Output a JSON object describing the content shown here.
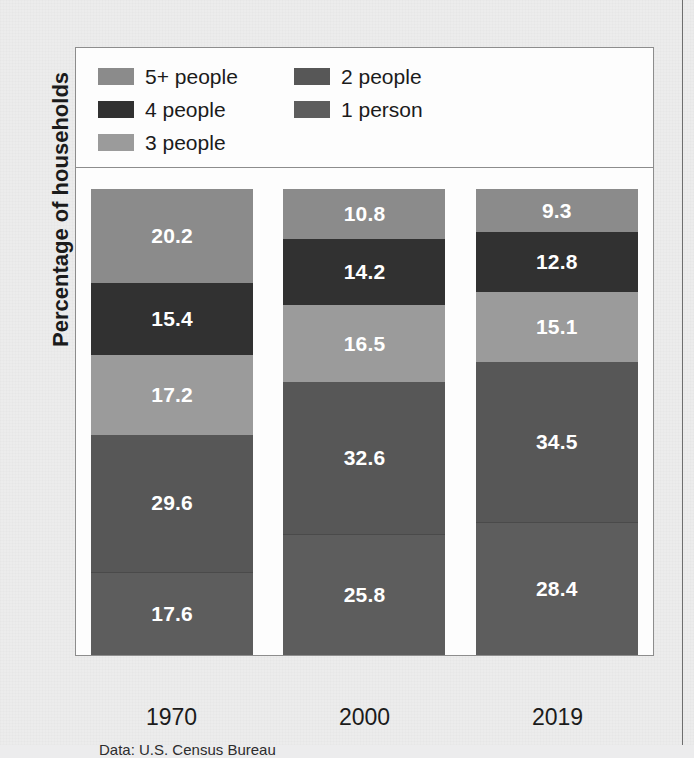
{
  "page": {
    "background_color": "#ececec",
    "partial_title_above": "",
    "column_rule_color": "#6e6e6e"
  },
  "figure": {
    "y_axis_title": "Percentage of households",
    "source_note": "Data: U.S. Census Bureau"
  },
  "legend": {
    "items": [
      {
        "label": "5+ people",
        "color": "#8b8b8b"
      },
      {
        "label": "2 people",
        "color": "#575757"
      },
      {
        "label": "4 people",
        "color": "#313131"
      },
      {
        "label": "1 person",
        "color": "#5d5d5d"
      },
      {
        "label": "3 people",
        "color": "#9b9b9b"
      }
    ]
  },
  "chart_data": {
    "type": "bar",
    "subtype": "stacked-vertical-100pct",
    "title": "",
    "xlabel": "",
    "ylabel": "Percentage of households",
    "ylim": [
      0,
      100
    ],
    "grid": false,
    "legend_position": "top",
    "categories": [
      "1970",
      "2000",
      "2019"
    ],
    "stack_order_top_to_bottom": [
      "5+ people",
      "4 people",
      "3 people",
      "2 people",
      "1 person"
    ],
    "series": [
      {
        "name": "5+ people",
        "color": "#8b8b8b",
        "values": [
          20.2,
          10.8,
          9.3
        ]
      },
      {
        "name": "4 people",
        "color": "#313131",
        "values": [
          15.4,
          14.2,
          12.8
        ]
      },
      {
        "name": "3 people",
        "color": "#9b9b9b",
        "values": [
          17.2,
          16.5,
          15.1
        ]
      },
      {
        "name": "2 people",
        "color": "#575757",
        "values": [
          29.6,
          32.6,
          34.5
        ]
      },
      {
        "name": "1 person",
        "color": "#5d5d5d",
        "values": [
          17.6,
          25.8,
          28.4
        ]
      }
    ],
    "columns": [
      {
        "category": "1970",
        "segments": [
          {
            "name": "5+ people",
            "value": 20.2,
            "label": "20.2",
            "color": "#8b8b8b"
          },
          {
            "name": "4 people",
            "value": 15.4,
            "label": "15.4",
            "color": "#313131"
          },
          {
            "name": "3 people",
            "value": 17.2,
            "label": "17.2",
            "color": "#9b9b9b"
          },
          {
            "name": "2 people",
            "value": 29.6,
            "label": "29.6",
            "color": "#575757"
          },
          {
            "name": "1 person",
            "value": 17.6,
            "label": "17.6",
            "color": "#5d5d5d"
          }
        ]
      },
      {
        "category": "2000",
        "segments": [
          {
            "name": "5+ people",
            "value": 10.8,
            "label": "10.8",
            "color": "#8b8b8b"
          },
          {
            "name": "4 people",
            "value": 14.2,
            "label": "14.2",
            "color": "#313131"
          },
          {
            "name": "3 people",
            "value": 16.5,
            "label": "16.5",
            "color": "#9b9b9b"
          },
          {
            "name": "2 people",
            "value": 32.6,
            "label": "32.6",
            "color": "#575757"
          },
          {
            "name": "1 person",
            "value": 25.8,
            "label": "25.8",
            "color": "#5d5d5d"
          }
        ]
      },
      {
        "category": "2019",
        "segments": [
          {
            "name": "5+ people",
            "value": 9.3,
            "label": "9.3",
            "color": "#8b8b8b"
          },
          {
            "name": "4 people",
            "value": 12.8,
            "label": "12.8",
            "color": "#313131"
          },
          {
            "name": "3 people",
            "value": 15.1,
            "label": "15.1",
            "color": "#9b9b9b"
          },
          {
            "name": "2 people",
            "value": 34.5,
            "label": "34.5",
            "color": "#575757"
          },
          {
            "name": "1 person",
            "value": 28.4,
            "label": "28.4",
            "color": "#5d5d5d"
          }
        ]
      }
    ]
  }
}
